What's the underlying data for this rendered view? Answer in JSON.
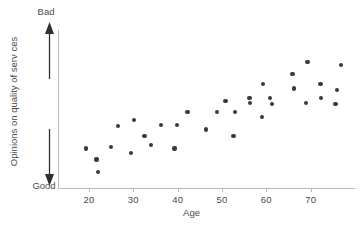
{
  "chart_data": {
    "type": "scatter",
    "title": "",
    "xlabel": "Age",
    "ylabel": "Opinions on quality of serv ces",
    "xlim": [
      13,
      80
    ],
    "ylim": [
      0,
      100
    ],
    "grid": false,
    "legend": null,
    "x_ticks": [
      20,
      30,
      40,
      50,
      60,
      70
    ],
    "x_tick_labels": [
      "20",
      "30",
      "40",
      "50",
      "60",
      "70"
    ],
    "y_ticks": [],
    "y_tick_labels": [],
    "y_axis_poles": {
      "high_label": "Bad",
      "low_label": "Good",
      "high_arrow": "arrow-up-icon",
      "low_arrow": "arrow-down-icon"
    },
    "point_color": "#3a3a3a",
    "axis_color": "#b9b9b9",
    "text_color": "#4a4a4a",
    "points": [
      {
        "x": 19.3,
        "y": 25
      },
      {
        "x": 21.7,
        "y": 18
      },
      {
        "x": 22.0,
        "y": 10
      },
      {
        "x": 25.0,
        "y": 26
      },
      {
        "x": 26.5,
        "y": 39
      },
      {
        "x": 29.5,
        "y": 22
      },
      {
        "x": 30.2,
        "y": 43
      },
      {
        "x": 32.5,
        "y": 33
      },
      {
        "x": 34.0,
        "y": 27
      },
      {
        "x": 36.2,
        "y": 40
      },
      {
        "x": 39.3,
        "y": 25
      },
      {
        "x": 39.8,
        "y": 40
      },
      {
        "x": 42.2,
        "y": 48
      },
      {
        "x": 46.3,
        "y": 37
      },
      {
        "x": 48.8,
        "y": 48
      },
      {
        "x": 50.8,
        "y": 55
      },
      {
        "x": 52.6,
        "y": 33
      },
      {
        "x": 52.9,
        "y": 48
      },
      {
        "x": 56.2,
        "y": 57
      },
      {
        "x": 56.4,
        "y": 54
      },
      {
        "x": 59.1,
        "y": 45
      },
      {
        "x": 59.3,
        "y": 66
      },
      {
        "x": 60.9,
        "y": 57
      },
      {
        "x": 61.3,
        "y": 53
      },
      {
        "x": 65.9,
        "y": 72
      },
      {
        "x": 66.2,
        "y": 63
      },
      {
        "x": 69.3,
        "y": 80
      },
      {
        "x": 69.0,
        "y": 54
      },
      {
        "x": 72.2,
        "y": 66
      },
      {
        "x": 72.4,
        "y": 57
      },
      {
        "x": 75.6,
        "y": 53
      },
      {
        "x": 76.0,
        "y": 62
      },
      {
        "x": 76.8,
        "y": 78
      }
    ]
  }
}
